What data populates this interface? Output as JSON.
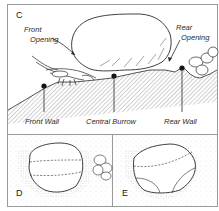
{
  "panels": {
    "c": {
      "letter": "C",
      "labels": {
        "front_opening_1": "Front",
        "front_opening_2": "Opening",
        "rear_opening_1": "Rear",
        "rear_opening_2": "Opening",
        "front_wall": "Front Wall",
        "central_burrow": "Central Burrow",
        "rear_wall": "Rear Wall"
      }
    },
    "d": {
      "letter": "D"
    },
    "e": {
      "letter": "E"
    }
  },
  "colors": {
    "ink": "#2a2a2a",
    "frame": "#9a9a9a",
    "stipple": "#bdbdbd"
  }
}
